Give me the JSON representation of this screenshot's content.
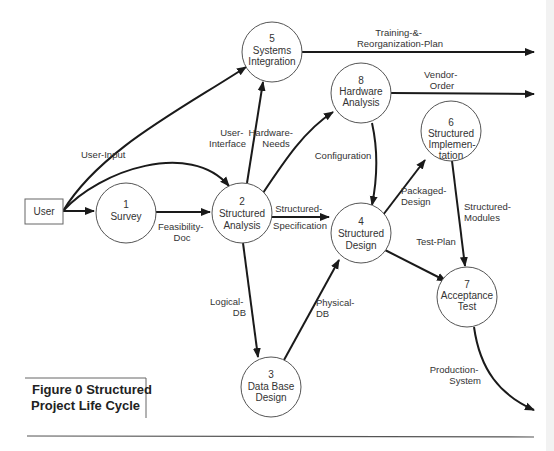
{
  "figure": {
    "caption_line1": "Figure 0 Structured",
    "caption_line2": "Project Life Cycle"
  },
  "external_entity": {
    "label": "User"
  },
  "processes": [
    {
      "id": "1",
      "number": "1",
      "lines": [
        "Survey"
      ]
    },
    {
      "id": "2",
      "number": "2",
      "lines": [
        "Structured",
        "Analysis"
      ]
    },
    {
      "id": "3",
      "number": "3",
      "lines": [
        "Data Base",
        "Design"
      ]
    },
    {
      "id": "4",
      "number": "4",
      "lines": [
        "Structured",
        "Design"
      ]
    },
    {
      "id": "5",
      "number": "5",
      "lines": [
        "Systems",
        "Integration"
      ]
    },
    {
      "id": "6",
      "number": "6",
      "lines": [
        "Structured",
        "Implemen-",
        "tation"
      ]
    },
    {
      "id": "7",
      "number": "7",
      "lines": [
        "Acceptance",
        "Test"
      ]
    },
    {
      "id": "8",
      "number": "8",
      "lines": [
        "Hardware",
        "Analysis"
      ]
    }
  ],
  "flows": [
    {
      "from": "User",
      "to": "1",
      "lines": []
    },
    {
      "from": "User",
      "to": "5",
      "lines": [
        "User-Input"
      ]
    },
    {
      "from": "User",
      "to": "2",
      "lines": []
    },
    {
      "from": "1",
      "to": "2",
      "lines": [
        "Feasibility-",
        "Doc"
      ]
    },
    {
      "from": "2",
      "to": "5",
      "lines": [
        "User-",
        "Interface"
      ]
    },
    {
      "from": "2",
      "to": "8",
      "lines": [
        "Hardware-",
        "Needs"
      ]
    },
    {
      "from": "2",
      "to": "4",
      "lines": [
        "Structured-",
        "Specification"
      ]
    },
    {
      "from": "2",
      "to": "3",
      "lines": [
        "Logical-",
        "DB"
      ]
    },
    {
      "from": "3",
      "to": "4",
      "lines": [
        "Physical-",
        "DB"
      ]
    },
    {
      "from": "8",
      "to": "4",
      "lines": [
        "Configuration"
      ]
    },
    {
      "from": "4",
      "to": "6",
      "lines": [
        "Packaged-",
        "Design"
      ]
    },
    {
      "from": "4",
      "to": "7",
      "lines": [
        "Test-Plan"
      ]
    },
    {
      "from": "6",
      "to": "7",
      "lines": [
        "Structured-",
        "Modules"
      ]
    },
    {
      "from": "5",
      "to": "out",
      "lines": [
        "Training-&-",
        "Reorganization-Plan"
      ]
    },
    {
      "from": "8",
      "to": "out",
      "lines": [
        "Vendor-",
        "Order"
      ]
    },
    {
      "from": "7",
      "to": "out",
      "lines": [
        "Production-",
        "System"
      ]
    }
  ]
}
